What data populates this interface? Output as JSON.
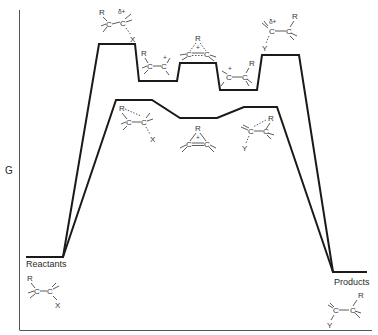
{
  "diagram": {
    "type": "free-energy reaction coordinate diagram",
    "y_axis_label": "G",
    "x_axis_label": "",
    "colors": {
      "line": "#1a1a1a",
      "axis": "#555555",
      "text": "#2a2a2a"
    },
    "endpoints": {
      "reactants": {
        "label": "Reactants",
        "structure": "R-C-C-X (alkyl halide)"
      },
      "products": {
        "label": "Products",
        "structure": "Y-C-C-R (rearranged substitution product)"
      }
    },
    "upper_path": {
      "description": "Open carbocation pathway",
      "stages": [
        {
          "id": "ts1",
          "kind": "transition state",
          "structure": "R-C-C(δ+)···X",
          "charge_label": "δ+"
        },
        {
          "id": "int1",
          "kind": "intermediate",
          "structure": "R-C-C+ (primary open cation)",
          "charge_label": "+"
        },
        {
          "id": "ts2",
          "kind": "transition state",
          "structure": "bridged R over C=C with +",
          "charge_label": "+"
        },
        {
          "id": "int2",
          "kind": "intermediate",
          "structure": "C+-C-R (rearranged open cation)",
          "charge_label": "+"
        },
        {
          "id": "ts3",
          "kind": "transition state",
          "structure": "Y···C(δ+)-C-R",
          "charge_label": "δ+"
        }
      ]
    },
    "lower_path": {
      "description": "Bridged (neighboring-group participation) pathway",
      "stages": [
        {
          "id": "ts1b",
          "kind": "transition state",
          "structure": "R bridging C-C···X"
        },
        {
          "id": "int_b",
          "kind": "intermediate",
          "structure": "bridged cation, R over C=C with +",
          "charge_label": "+"
        },
        {
          "id": "ts2b",
          "kind": "transition state",
          "structure": "Y···C-C with R bridging"
        }
      ]
    },
    "atoms": {
      "R": "R",
      "C": "C",
      "X": "X",
      "Y": "Y",
      "plus": "+",
      "delta_plus": "δ+"
    }
  }
}
